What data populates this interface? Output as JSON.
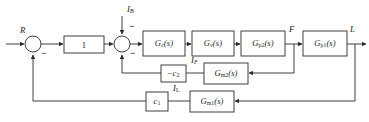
{
  "figure": {
    "type": "block-diagram",
    "domain": "control-systems",
    "line_color": "#2b2b2b",
    "background_color": "#ffffff"
  },
  "signals": {
    "reference": "R",
    "disturbance": "I",
    "disturbance_sub": "B",
    "flow": "F",
    "level_output": "L",
    "flow_current": "I",
    "flow_current_sub": "F",
    "level_current": "I",
    "level_current_sub": "L"
  },
  "blocks": [
    {
      "id": "unity",
      "label": "1",
      "sub": "",
      "suffix": "",
      "x": 64,
      "y": 36,
      "w": 40,
      "h": 17
    },
    {
      "id": "controller",
      "label": "G",
      "sub": "c",
      "suffix": "(s)",
      "x": 143,
      "y": 31,
      "w": 42,
      "h": 25
    },
    {
      "id": "valve",
      "label": "G",
      "sub": "v",
      "suffix": "(s)",
      "x": 192,
      "y": 31,
      "w": 42,
      "h": 25
    },
    {
      "id": "process2",
      "label": "G",
      "sub": "p2",
      "suffix": "(s)",
      "x": 241,
      "y": 31,
      "w": 44,
      "h": 25
    },
    {
      "id": "process1",
      "label": "G",
      "sub": "p1",
      "suffix": "(s)",
      "x": 303,
      "y": 31,
      "w": 44,
      "h": 25
    },
    {
      "id": "gain2",
      "label": "−c",
      "sub": "2",
      "suffix": "",
      "x": 161,
      "y": 65,
      "w": 25,
      "h": 17
    },
    {
      "id": "meas2",
      "label": "G",
      "sub": "m2",
      "suffix": "(s)",
      "x": 204,
      "y": 63,
      "w": 44,
      "h": 21
    },
    {
      "id": "gain1",
      "label": "c",
      "sub": "1",
      "suffix": "",
      "x": 146,
      "y": 92,
      "w": 22,
      "h": 19
    },
    {
      "id": "meas1",
      "label": "G",
      "sub": "m1",
      "suffix": "(s)",
      "x": 190,
      "y": 91,
      "w": 44,
      "h": 21
    }
  ],
  "summing_junctions": [
    {
      "id": "outer-sum",
      "cx": 33,
      "cy": 44,
      "r": 8,
      "inputs": [
        {
          "from": "left",
          "sign": ""
        },
        {
          "from": "bottom",
          "sign": "−"
        }
      ]
    },
    {
      "id": "inner-sum",
      "cx": 122,
      "cy": 44,
      "r": 8,
      "inputs": [
        {
          "from": "left",
          "sign": ""
        },
        {
          "from": "top",
          "sign": "−"
        },
        {
          "from": "bottom",
          "sign": "−"
        }
      ]
    }
  ],
  "labels": {
    "R": "R",
    "IB": "I",
    "IB_sub": "B",
    "F": "F",
    "L": "L",
    "IF": "I",
    "IF_sub": "F",
    "IL": "I",
    "IL_sub": "L",
    "minus": "−"
  }
}
